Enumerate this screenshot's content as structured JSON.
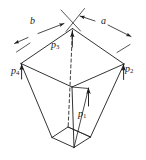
{
  "figure": {
    "type": "technical-line-diagram",
    "stroke_color": "#1c1c1c",
    "background_color": "#ffffff",
    "dimension_labels": [
      {
        "id": "b",
        "text": "b",
        "x": 30,
        "y": 17,
        "description": "left top edge dimension"
      },
      {
        "id": "a",
        "text": "a",
        "x": 101,
        "y": 17,
        "description": "right top edge dimension"
      }
    ],
    "load_labels": [
      {
        "id": "p1",
        "base": "p",
        "sub": "1",
        "x": 79,
        "y": 110,
        "description": "front face load arrow"
      },
      {
        "id": "p2",
        "base": "p",
        "sub": "2",
        "x": 125,
        "y": 65,
        "description": "right corner load arrow"
      },
      {
        "id": "p3",
        "base": "p",
        "sub": "3",
        "x": 51,
        "y": 41,
        "description": "back/top vertex load arrow"
      },
      {
        "id": "p4",
        "base": "p",
        "sub": "4",
        "x": 12,
        "y": 66,
        "description": "left corner load arrow"
      }
    ],
    "geometry": {
      "top_face": {
        "name": "top-parallelogram",
        "vertices": [
          {
            "name": "apex-back",
            "x": 72.5,
            "y": 28.5
          },
          {
            "name": "corner-right",
            "x": 124.0,
            "y": 64.0
          },
          {
            "name": "apex-front",
            "x": 72.0,
            "y": 87.0
          },
          {
            "name": "corner-left",
            "x": 21.0,
            "y": 63.5
          }
        ]
      },
      "bottom_face": {
        "name": "bottom-quadrilateral",
        "vertices": [
          {
            "name": "b-back",
            "x": 68.0,
            "y": 127.0
          },
          {
            "name": "b-right",
            "x": 90.5,
            "y": 137.0
          },
          {
            "name": "b-front",
            "x": 74.0,
            "y": 147.5
          },
          {
            "name": "b-left",
            "x": 52.0,
            "y": 137.5
          }
        ]
      },
      "centerline": {
        "name": "dashed-axis",
        "x1": 72.5,
        "y1": 28.5,
        "x2": 68.0,
        "y2": 127.0
      }
    }
  }
}
